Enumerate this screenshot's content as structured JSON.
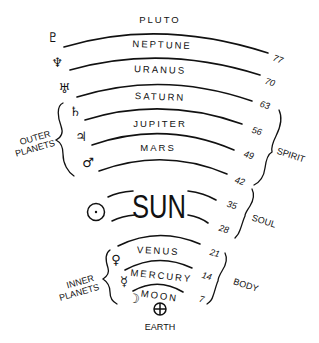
{
  "planets": {
    "pluto": {
      "name": "PLUTO",
      "symbol": "♇"
    },
    "neptune": {
      "name": "NEPTUNE",
      "symbol": "♆"
    },
    "uranus": {
      "name": "URANUS",
      "symbol": "♅"
    },
    "saturn": {
      "name": "SATURN",
      "symbol": "♄"
    },
    "jupiter": {
      "name": "JUPITER",
      "symbol": "♃"
    },
    "mars": {
      "name": "MARS",
      "symbol": "♂"
    },
    "sun": {
      "name": "SUN",
      "symbol": "☉"
    },
    "venus": {
      "name": "VENUS",
      "symbol": "♀"
    },
    "mercury": {
      "name": "MERCURY",
      "symbol": "☿"
    },
    "moon": {
      "name": "MOON",
      "symbol": "☽"
    },
    "earth": {
      "name": "EARTH",
      "symbol": "⊕"
    }
  },
  "ages": [
    "77",
    "70",
    "63",
    "56",
    "49",
    "42",
    "35",
    "28",
    "21",
    "14",
    "7"
  ],
  "groups": {
    "outer_line1": "OUTER",
    "outer_line2": "PLANETS",
    "inner_line1": "INNER",
    "inner_line2": "PLANETS",
    "spirit": "SPIRIT",
    "soul": "SOUL",
    "body": "BODY"
  }
}
